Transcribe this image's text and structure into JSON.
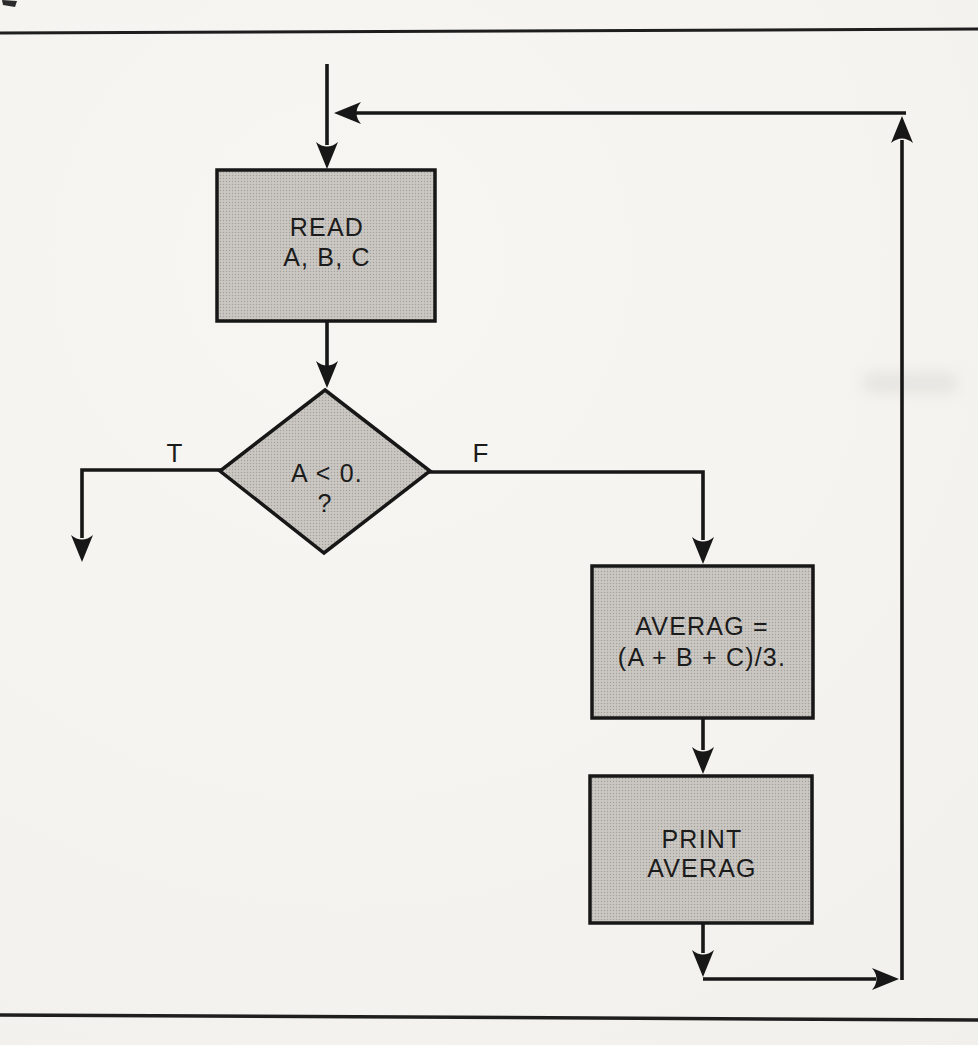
{
  "palette": {
    "background": "#f4f3ef",
    "ink": "#1b1b1b",
    "node_fill": "#c7c4bf",
    "halftone_dot": "#a4a19c"
  },
  "flowchart": {
    "read": {
      "type": "process",
      "line1": "READ",
      "line2": "A, B, C"
    },
    "decision": {
      "type": "decision",
      "line1": "A < 0.",
      "line2": "?"
    },
    "true_label": "T",
    "false_label": "F",
    "assign": {
      "type": "process",
      "line1": "AVERAG =",
      "line2": "(A + B + C)/3."
    },
    "print": {
      "type": "process",
      "line1": "PRINT",
      "line2": "AVERAG"
    }
  }
}
